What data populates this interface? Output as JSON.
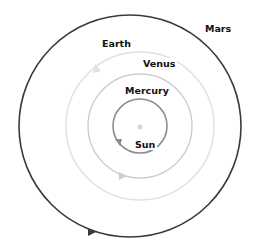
{
  "diagram": {
    "type": "orbit-diagram",
    "center": {
      "name": "Sun",
      "x": 140,
      "y": 126,
      "color": "#d8d8d8"
    },
    "orbits": [
      {
        "name": "Mercury",
        "cx": 140,
        "cy": 126,
        "r": 27,
        "color": "#8a8a8a",
        "width": 1.6,
        "arrow_angle_deg": 150
      },
      {
        "name": "Venus",
        "cx": 140,
        "cy": 126,
        "r": 52,
        "color": "#c8c8c8",
        "width": 1.4,
        "arrow_angle_deg": 105
      },
      {
        "name": "Earth",
        "cx": 140,
        "cy": 126,
        "r": 74,
        "color": "#dedede",
        "width": 1.4,
        "arrow_angle_deg": 235
      },
      {
        "name": "Mars",
        "cx": 130,
        "cy": 126,
        "r": 112,
        "color": "#3a3a3a",
        "width": 1.6,
        "arrow_angle_deg": 118
      }
    ]
  },
  "labels": {
    "mars": "Mars",
    "earth": "Earth",
    "venus": "Venus",
    "mercury": "Mercury",
    "sun": "Sun"
  }
}
